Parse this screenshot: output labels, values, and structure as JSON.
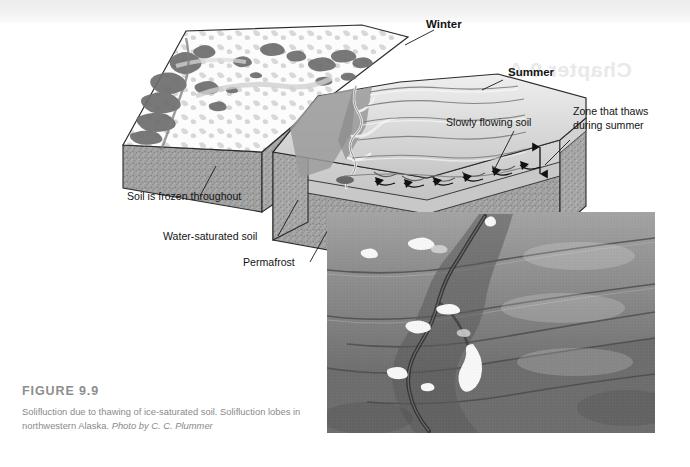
{
  "figure": {
    "label": "FIGURE 9.9",
    "caption_main": "Solifluction due to thawing of ice-saturated soil. Solifluction lobes in northwestern Alaska.",
    "credit": "Photo by C. C. Plummer",
    "label_color": "#8e8e8e",
    "caption_color": "#8a8a8a"
  },
  "diagram": {
    "type": "block-diagram-pair",
    "blocks": [
      {
        "name": "winter-block",
        "title": "Winter"
      },
      {
        "name": "summer-block",
        "title": "Summer"
      }
    ],
    "labels": [
      {
        "id": "winter",
        "text": "Winter",
        "x": 426,
        "y": 28,
        "align": "left",
        "bold": true
      },
      {
        "id": "summer",
        "text": "Summer",
        "x": 508,
        "y": 76,
        "align": "left",
        "bold": true
      },
      {
        "id": "slowly-flowing-soil",
        "text": "Slowly flowing soil",
        "x": 446,
        "y": 126,
        "align": "left",
        "bold": false
      },
      {
        "id": "zone-that-thaws-1",
        "text": "Zone that thaws",
        "x": 573,
        "y": 115,
        "align": "left",
        "bold": false
      },
      {
        "id": "zone-that-thaws-2",
        "text": "during summer",
        "x": 573,
        "y": 129,
        "align": "left",
        "bold": false
      },
      {
        "id": "soil-frozen",
        "text": "Soil is frozen throughout",
        "x": 127,
        "y": 200,
        "align": "left",
        "bold": false
      },
      {
        "id": "water-saturated",
        "text": "Water-saturated soil",
        "x": 163,
        "y": 240,
        "align": "left",
        "bold": false
      },
      {
        "id": "permafrost",
        "text": "Permafrost",
        "x": 243,
        "y": 266,
        "align": "left",
        "bold": false
      }
    ],
    "layers": {
      "snow_surface": "#fdfdfd",
      "vegetation_dark": "#6a6a6a",
      "thaw_zone": "#cfcfcf",
      "permafrost": "#9d9d9d",
      "soil_frozen": "#9d9d9d",
      "flow_arrow": "#111111"
    }
  },
  "ghost": {
    "text": "Chapter 9  A"
  },
  "photo": {
    "name": "solifluction-lobes-photo",
    "alt": "Aerial photograph of solifluction lobes with a meandering stream and snow patches, northwestern Alaska",
    "x": 327,
    "y": 212,
    "width": 328,
    "height": 221
  }
}
